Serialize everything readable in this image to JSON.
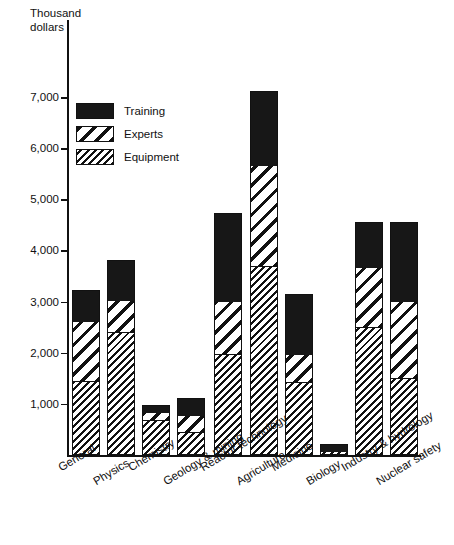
{
  "chart_data": {
    "type": "bar",
    "subtype": "stacked-vertical",
    "title": "",
    "xlabel": "",
    "ylabel": "Thousand\ndollars",
    "ylim": [
      0,
      7600
    ],
    "yticks": [
      1000,
      2000,
      3000,
      4000,
      5000,
      6000,
      7000
    ],
    "ytick_labels": [
      "1,000",
      "2,000",
      "3,000",
      "4,000",
      "5,000",
      "6,000",
      "7,000"
    ],
    "grid": false,
    "legend_position": "upper-left-inside",
    "categories": [
      "General",
      "Physics",
      "Chemistry",
      "Geology & mining",
      "Reactor technology",
      "Agriculture",
      "Medicine",
      "Biology",
      "Industry & hydrology",
      "Nuclear safety"
    ],
    "series": [
      {
        "name": "Equipment",
        "color": "#111111",
        "pattern": "fine-diagonal-hatch",
        "values": [
          1430,
          2400,
          680,
          430,
          1960,
          3680,
          1400,
          60,
          2480,
          1470
        ]
      },
      {
        "name": "Experts",
        "color": "#111111",
        "pattern": "wide-diagonal-hatch",
        "values": [
          1190,
          620,
          160,
          340,
          1040,
          1990,
          560,
          0,
          1180,
          1530
        ]
      },
      {
        "name": "Training",
        "color": "#171717",
        "pattern": "solid",
        "values": [
          600,
          790,
          140,
          350,
          1740,
          1450,
          1180,
          150,
          900,
          1560
        ]
      }
    ],
    "totals": [
      3220,
      3810,
      980,
      1120,
      4740,
      7120,
      3140,
      210,
      4560,
      4560
    ]
  },
  "legend": {
    "items": [
      {
        "label": "Training",
        "swatch": "solid-black"
      },
      {
        "label": "Experts",
        "swatch": "wide-diagonal-hatch"
      },
      {
        "label": "Equipment",
        "swatch": "fine-diagonal-hatch"
      }
    ]
  }
}
